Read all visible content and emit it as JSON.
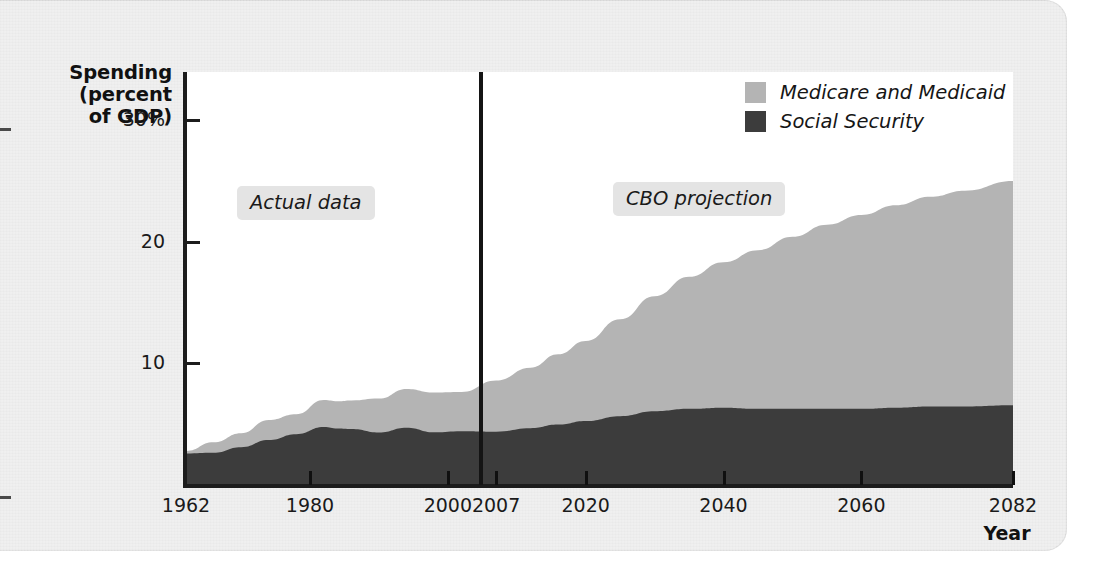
{
  "figure": {
    "y_axis_title": "Spending\n(percent\nof GDP)",
    "y_axis_title_line1": "Spending",
    "y_axis_title_line2": "(percent",
    "y_axis_title_line3": "of GDP)",
    "x_axis_title": "Year"
  },
  "annotations": {
    "actual": "Actual data",
    "projection": "CBO projection"
  },
  "legend": {
    "items": [
      {
        "label": "Medicare and Medicaid",
        "color": "#b4b4b4"
      },
      {
        "label": "Social Security",
        "color": "#3c3c3c"
      }
    ]
  },
  "chart_data": {
    "type": "area",
    "title": "",
    "subtitle": "",
    "xlabel": "Year",
    "ylabel": "Spending (percent of GDP)",
    "stacked": true,
    "grid": false,
    "legend_position": "top-right",
    "xlim": [
      1962,
      2082
    ],
    "ylim": [
      0,
      34
    ],
    "xticks": [
      1962,
      1980,
      2000,
      2007,
      2020,
      2040,
      2060,
      2082
    ],
    "xticklabels": [
      "1962",
      "1980",
      "2000",
      "2007",
      "2020",
      "2040",
      "2060",
      "2082"
    ],
    "yticks": [
      10,
      20,
      30
    ],
    "yticklabels": [
      "10",
      "20",
      "30%"
    ],
    "divider": {
      "x": 2007,
      "label_left": "Actual data",
      "label_right": "CBO projection"
    },
    "x": [
      1962,
      1966,
      1970,
      1974,
      1978,
      1982,
      1984,
      1986,
      1990,
      1994,
      1998,
      2002,
      2007,
      2012,
      2016,
      2020,
      2025,
      2030,
      2035,
      2040,
      2045,
      2050,
      2055,
      2060,
      2065,
      2070,
      2075,
      2082
    ],
    "series": [
      {
        "name": "Social Security",
        "color": "#3c3c3c",
        "values": [
          2.5,
          2.7,
          3.0,
          3.8,
          4.1,
          4.8,
          4.6,
          4.5,
          4.3,
          4.5,
          4.3,
          4.2,
          4.3,
          4.6,
          4.9,
          5.2,
          5.6,
          6.0,
          6.2,
          6.3,
          6.2,
          6.2,
          6.2,
          6.2,
          6.3,
          6.4,
          6.4,
          6.5
        ]
      },
      {
        "name": "Medicare and Medicaid",
        "color": "#b4b4b4",
        "values": [
          0.3,
          0.8,
          1.1,
          1.5,
          1.7,
          2.1,
          2.2,
          2.4,
          2.8,
          3.3,
          3.2,
          3.5,
          4.2,
          5.0,
          5.8,
          6.6,
          8.0,
          9.5,
          10.9,
          12.0,
          13.1,
          14.2,
          15.2,
          16.0,
          16.7,
          17.3,
          17.8,
          18.5
        ]
      }
    ],
    "totals_note": {
      "value_1962": 2.8,
      "value_2007": 8.5,
      "value_2082": 25.0
    }
  }
}
